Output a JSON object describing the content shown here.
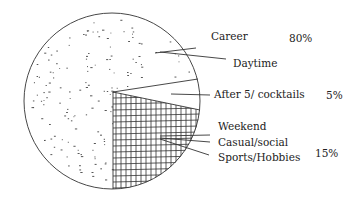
{
  "chart_data": {
    "type": "pie",
    "title": "",
    "style": "hand-drawn sketch with stippled and cross-hatched fills",
    "slices": [
      {
        "group": "Career",
        "items": [
          "Career",
          "Daytime"
        ],
        "value": 80,
        "label": "80%",
        "fill": "stippled"
      },
      {
        "group": "After 5",
        "items": [
          "After 5/ cocktails"
        ],
        "value": 5,
        "label": "5%",
        "fill": "blank"
      },
      {
        "group": "Weekend",
        "items": [
          "Weekend",
          "Casual/social",
          "Sports/Hobbies"
        ],
        "value": 15,
        "label": "15%",
        "fill": "cross-hatched"
      }
    ],
    "legend": "none; labels placed to the right with leader lines"
  },
  "labels": {
    "career": "Career",
    "career_pct": "80%",
    "daytime": "Daytime",
    "after5": "After 5/ cocktails",
    "after5_pct": "5%",
    "weekend": "Weekend",
    "casual": "Casual/social",
    "sports": "Sports/Hobbies",
    "weekend_pct": "15%"
  },
  "colors": {
    "ink": "#333333",
    "background": "#ffffff"
  }
}
